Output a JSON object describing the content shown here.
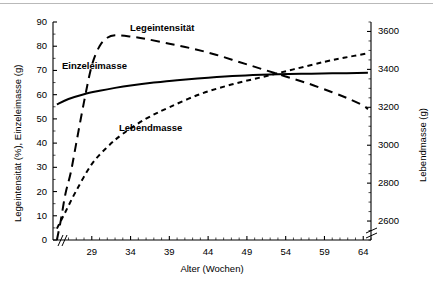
{
  "chart_data": {
    "type": "line",
    "title": "",
    "xlabel": "Alter (Wochen)",
    "ylabel_left": "Legeintensität (%), Einzeleimasse (g)",
    "ylabel_right": "Lebendmasse (g)",
    "xlim": [
      24,
      65
    ],
    "xticks": [
      29,
      34,
      39,
      44,
      49,
      54,
      59,
      64
    ],
    "xtick_labels": [
      "29",
      "34",
      "39",
      "44",
      "49",
      "54",
      "59",
      "64"
    ],
    "ylim_left": [
      0,
      90
    ],
    "yticks_left": [
      0,
      10,
      20,
      30,
      40,
      50,
      60,
      70,
      80,
      90
    ],
    "ytick_labels_left": [
      "0",
      "10",
      "20",
      "30",
      "40",
      "50",
      "60",
      "70",
      "80",
      "90"
    ],
    "ylim_right": [
      2500,
      3650
    ],
    "yticks_right": [
      2600,
      2800,
      3000,
      3200,
      3400,
      3600
    ],
    "ytick_labels_right": [
      "2600",
      "2800",
      "3000",
      "3200",
      "3400",
      "3600"
    ],
    "grid": false,
    "axis_break_x": true,
    "axis_break_y_right": true,
    "legend_position": "inline-labels",
    "series": [
      {
        "name": "Legeintensität",
        "label": "Legeintensität",
        "axis": "left",
        "unit": "%",
        "linestyle": "long-dash",
        "color": "#000000",
        "x": [
          24.5,
          25.0,
          25.6,
          26.3,
          27.0,
          28.0,
          29.0,
          30.0,
          31.0,
          32.0,
          34.0,
          36.0,
          39.0,
          42.0,
          45.0,
          48.0,
          51.0,
          54.0,
          57.0,
          60.0,
          62.0,
          64.0,
          64.6
        ],
        "values": [
          0,
          8,
          19,
          28,
          40,
          57,
          72,
          80,
          83.5,
          84.5,
          84,
          83,
          81,
          79,
          76.5,
          73.5,
          70.5,
          67.5,
          64.5,
          61,
          58.5,
          55.5,
          54
        ]
      },
      {
        "name": "Einzeleimasse",
        "label": "Einzeleimasse",
        "axis": "left",
        "unit": "g",
        "linestyle": "solid",
        "color": "#000000",
        "x": [
          24.5,
          26.0,
          28.0,
          30.0,
          32.0,
          34.0,
          37.0,
          40.0,
          44.0,
          48.0,
          52.0,
          56.0,
          60.0,
          64.6
        ],
        "values": [
          56,
          58.2,
          60.2,
          61.6,
          62.8,
          63.8,
          65.0,
          66.0,
          67.0,
          67.8,
          68.3,
          68.6,
          68.8,
          69.0
        ]
      },
      {
        "name": "Lebendmasse",
        "label": "Lebendmasse",
        "axis": "right",
        "unit": "g",
        "linestyle": "short-dash",
        "color": "#000000",
        "x": [
          24.5,
          25.5,
          27.0,
          29.0,
          31.0,
          33.0,
          36.0,
          39.0,
          43.0,
          47.0,
          51.0,
          55.0,
          59.0,
          62.0,
          64.6
        ],
        "values": [
          2560,
          2640,
          2760,
          2900,
          2990,
          3060,
          3140,
          3200,
          3270,
          3320,
          3360,
          3400,
          3440,
          3465,
          3485
        ]
      }
    ],
    "series_label_positions": [
      {
        "name": "Legeintensität",
        "x_px": 130,
        "y_px": 22
      },
      {
        "name": "Einzeleimasse",
        "x_px": 62,
        "y_px": 60
      },
      {
        "name": "Lebendmasse",
        "x_px": 119,
        "y_px": 122
      }
    ]
  }
}
